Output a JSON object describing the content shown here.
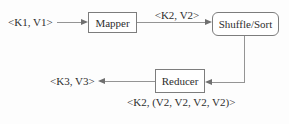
{
  "diagram": {
    "labels": {
      "input_pair": "<K1, V1>",
      "map_output_pair": "<K2, V2>",
      "final_output_pair": "<K3, V3>",
      "reduce_input_pair": "<K2, (V2, V2, V2, V2)>"
    },
    "nodes": {
      "mapper": "Mapper",
      "shuffle_sort": "Shuffle/Sort",
      "reducer": "Reducer"
    },
    "colors": {
      "background": "#fdfdfd",
      "line": "#949494",
      "arrowhead": "#6f6f6f",
      "box_border": "#7d7d7d",
      "box_fill": "#ffffff",
      "text": "#2e2e2e"
    }
  }
}
